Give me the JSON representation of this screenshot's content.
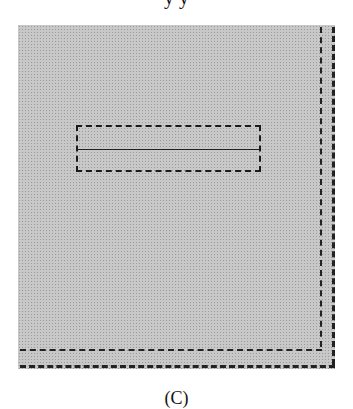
{
  "figure": {
    "top_text_fragment": "y                                              y",
    "caption_fragment": "(C)",
    "panel": {
      "fill": "stippled gray",
      "background_color": "#c8c8c8",
      "line_color": "#222222"
    },
    "elements": [
      {
        "type": "rectangle",
        "style": "dashed bold outline",
        "divided": "horizontal midline"
      },
      {
        "type": "inner-border",
        "style": "dashed",
        "sides": [
          "right",
          "bottom"
        ]
      },
      {
        "type": "outer-border",
        "style": "dashed bold",
        "sides": [
          "right",
          "bottom"
        ]
      }
    ]
  }
}
